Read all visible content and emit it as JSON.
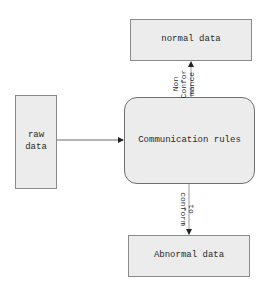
{
  "diagram": {
    "nodes": {
      "normal_data": {
        "label": "normal data"
      },
      "raw_data": {
        "label": "raw data"
      },
      "communication_rules": {
        "label": "Communication rules"
      },
      "abnormal_data": {
        "label": "Abnormal data"
      }
    },
    "edges": {
      "raw_to_rules": {
        "from": "raw data",
        "to": "Communication rules",
        "label": ""
      },
      "rules_to_normal": {
        "from": "Communication rules",
        "to": "normal data",
        "label_lines": [
          "Non",
          "Confor",
          "mance"
        ]
      },
      "rules_to_abnormal": {
        "from": "Communication rules",
        "to": "Abnormal data",
        "label_lines": [
          "conform",
          "to"
        ]
      }
    },
    "colors": {
      "box_fill": "#ececec",
      "box_border": "#8a8a8a",
      "line": "#555555",
      "text": "#2a2a2a"
    }
  }
}
